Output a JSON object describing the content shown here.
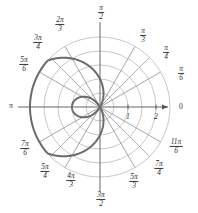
{
  "figure": {
    "type": "polar-plot",
    "background": "#ffffff",
    "curve_color": "#6b6b6b",
    "grid_color": "#9a9a9a",
    "axis_color": "#555555",
    "label_color": "#2b2b2b"
  },
  "axis_labels": {
    "zero": "0",
    "pi": "π"
  },
  "radial_ticks": [
    {
      "value": "1"
    },
    {
      "value": "2"
    }
  ],
  "angle_labels": [
    {
      "name": "pi-over-6",
      "num": "π",
      "den": "6"
    },
    {
      "name": "pi-over-4",
      "num": "π",
      "den": "4"
    },
    {
      "name": "pi-over-3",
      "num": "π",
      "den": "3"
    },
    {
      "name": "pi-over-2",
      "num": "π",
      "den": "2"
    },
    {
      "name": "two-pi-over-3",
      "num": "2π",
      "den": "3"
    },
    {
      "name": "three-pi-over-4",
      "num": "3π",
      "den": "4"
    },
    {
      "name": "five-pi-over-6",
      "num": "5π",
      "den": "6"
    },
    {
      "name": "seven-pi-over-6",
      "num": "7π",
      "den": "6"
    },
    {
      "name": "five-pi-over-4",
      "num": "5π",
      "den": "4"
    },
    {
      "name": "four-pi-over-3",
      "num": "4π",
      "den": "3"
    },
    {
      "name": "three-pi-over-2",
      "num": "3π",
      "den": "2"
    },
    {
      "name": "five-pi-over-3",
      "num": "5π",
      "den": "3"
    },
    {
      "name": "seven-pi-over-4",
      "num": "7π",
      "den": "4"
    },
    {
      "name": "eleven-pi-over-6",
      "num": "11π",
      "den": "6"
    }
  ],
  "chart_data": {
    "type": "line",
    "subtype": "polar",
    "title": "",
    "xlabel": "",
    "ylabel": "",
    "equation": "r = 1 - 2 cos(θ)",
    "theta_unit": "radians",
    "grid": true,
    "legend": false,
    "rlim": [
      0,
      2.5
    ],
    "r_gridlines": [
      0.5,
      1.0,
      1.5,
      2.0,
      2.5
    ],
    "r_tick_labels": [
      "1",
      "2"
    ],
    "theta_gridlines_deg": [
      0,
      30,
      45,
      60,
      90,
      120,
      135,
      150,
      180,
      210,
      225,
      240,
      270,
      300,
      315,
      330
    ],
    "series": [
      {
        "name": "limacon",
        "theta_deg": [
          0,
          10,
          20,
          30,
          40,
          50,
          60,
          70,
          80,
          90,
          100,
          110,
          120,
          130,
          140,
          150,
          160,
          170,
          180,
          190,
          200,
          210,
          220,
          230,
          240,
          250,
          260,
          270,
          280,
          290,
          300,
          310,
          320,
          330,
          340,
          350,
          360
        ],
        "r": [
          -1.0,
          -0.97,
          -0.88,
          -0.73,
          -0.53,
          -0.29,
          0.0,
          0.32,
          0.65,
          1.0,
          1.35,
          1.68,
          2.0,
          2.29,
          2.53,
          2.73,
          2.88,
          2.97,
          3.0,
          2.97,
          2.88,
          2.73,
          2.53,
          2.29,
          2.0,
          1.68,
          1.35,
          1.0,
          0.65,
          0.32,
          0.0,
          -0.29,
          -0.53,
          -0.73,
          -0.88,
          -0.97,
          -1.0
        ]
      }
    ]
  }
}
